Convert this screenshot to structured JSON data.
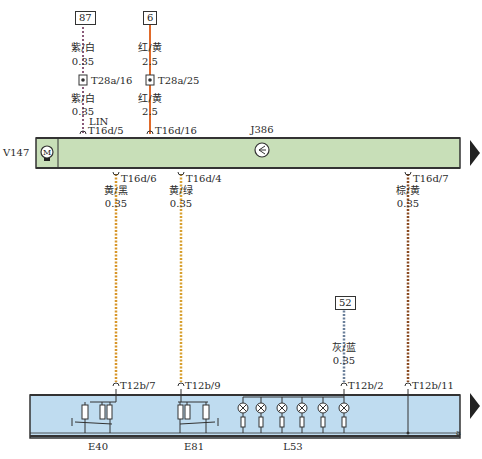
{
  "diagram": {
    "type": "wiring-schematic",
    "colors": {
      "module_top_fill": "#c8dfb8",
      "module_bottom_fill": "#bfdcf0",
      "wire_purple_white": "#8a5a7a",
      "wire_red_yellow": "#e06a2a",
      "wire_yellow_black": "#d8962a",
      "wire_yellow_green": "#d8a030",
      "wire_brown_yellow": "#8a4a20",
      "wire_grey_blue": "#6a7f9a"
    },
    "top_module": {
      "id": "J386",
      "motor_label": "V147",
      "motor_symbol": "M"
    },
    "bottom_module": {
      "components": [
        "E40",
        "E81",
        "L53"
      ],
      "ground_label": "a"
    },
    "terminals_top": [
      {
        "id": "87",
        "wire_color": "紫/白",
        "gauge1": "0.35",
        "connector": "T28a/16",
        "wire_color2": "紫/白",
        "gauge2": "0.35",
        "bus": "LIN",
        "pin": "T16d/5"
      },
      {
        "id": "6",
        "wire_color": "红/黄",
        "gauge1": "2.5",
        "connector": "T28a/25",
        "wire_color2": "红/黄",
        "gauge2": "2.5",
        "pin": "T16d/16"
      }
    ],
    "wires_down": [
      {
        "pin_top": "T16d/6",
        "wire_color": "黄/黑",
        "gauge": "0.35",
        "pin_bottom": "T12b/7"
      },
      {
        "pin_top": "T16d/4",
        "wire_color": "黄/绿",
        "gauge": "0.35",
        "pin_bottom": "T12b/9"
      },
      {
        "pin_top": "T16d/7",
        "wire_color": "棕/黄",
        "gauge": "0.35",
        "pin_bottom": "T12b/11"
      }
    ],
    "terminal_52": {
      "id": "52",
      "wire_color": "灰/蓝",
      "gauge": "0.35",
      "pin": "T12b/2"
    }
  }
}
